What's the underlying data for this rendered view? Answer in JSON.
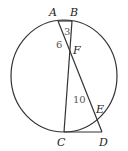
{
  "diagram": {
    "type": "circle-intersecting-chords",
    "points": {
      "A": {
        "label": "A"
      },
      "B": {
        "label": "B"
      },
      "C": {
        "label": "C"
      },
      "D": {
        "label": "D"
      },
      "E": {
        "label": "E"
      },
      "F": {
        "label": "F"
      }
    },
    "segment_labels": {
      "BF": "3",
      "AF": "6",
      "FE": "10"
    },
    "colors": {
      "line": "#333333",
      "label": "#222222",
      "number": "#555555"
    }
  }
}
